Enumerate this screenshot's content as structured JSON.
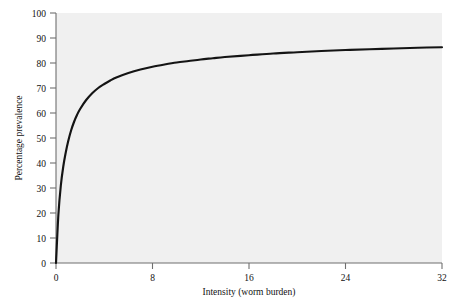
{
  "chart_data": {
    "type": "line",
    "title": "",
    "xlabel": "Intensity (worm burden)",
    "ylabel": "Percentage prevalence",
    "xlim": [
      0,
      32
    ],
    "ylim": [
      0,
      100
    ],
    "xticks": [
      0,
      8,
      16,
      24,
      32
    ],
    "yticks": [
      0,
      10,
      20,
      30,
      40,
      50,
      60,
      70,
      80,
      90,
      100
    ],
    "xtick_labels": [
      "0",
      "8",
      "16",
      "24",
      "32"
    ],
    "ytick_labels": [
      "0",
      "10",
      "20",
      "30",
      "40",
      "50",
      "60",
      "70",
      "80",
      "90",
      "100"
    ],
    "grid": false,
    "legend": false,
    "legend_position": "none",
    "background_color": "#f0f0f0",
    "curve_color": "#141414",
    "series": [
      {
        "name": "Prevalence vs intensity",
        "x": [
          0,
          0.2,
          0.4,
          0.6,
          0.8,
          1.0,
          1.25,
          1.5,
          1.75,
          2.0,
          2.5,
          3.0,
          3.5,
          4.0,
          4.5,
          5.0,
          6.0,
          7.0,
          8.0,
          9.0,
          10.0,
          11.0,
          12.0,
          13.0,
          14.0,
          16.0,
          18.0,
          20.0,
          22.0,
          24.0,
          26.0,
          28.0,
          30.0,
          32.0
        ],
        "y": [
          0,
          19.5,
          31.0,
          38.5,
          44.0,
          48.5,
          53.0,
          56.5,
          59.3,
          61.6,
          65.2,
          67.9,
          70.0,
          71.6,
          73.0,
          74.2,
          76.0,
          77.4,
          78.5,
          79.4,
          80.2,
          80.8,
          81.4,
          81.9,
          82.4,
          83.1,
          83.8,
          84.3,
          84.8,
          85.2,
          85.5,
          85.8,
          86.1,
          86.3
        ]
      }
    ]
  },
  "axis": {
    "x_title": "Intensity (worm burden)",
    "y_title": "Percentage prevalence"
  }
}
